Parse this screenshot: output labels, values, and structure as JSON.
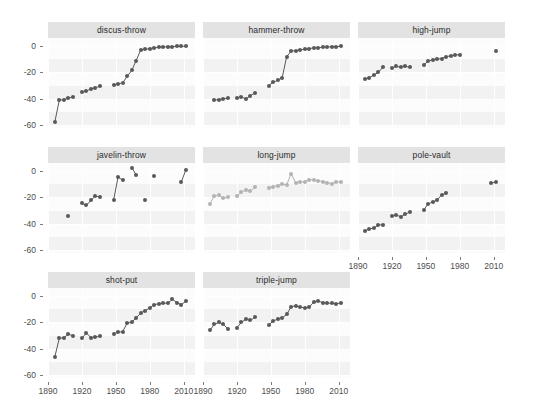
{
  "chart_data": {
    "type": "scatter",
    "title": "",
    "subtitle": "",
    "xlabel": "",
    "ylabel": "",
    "xlim": [
      1890,
      2020
    ],
    "ylim": [
      -62,
      6
    ],
    "xticks": [
      1890,
      1920,
      1950,
      1980,
      2010
    ],
    "yticks": [
      0,
      -20,
      -40,
      -60
    ],
    "xtick_labels": [
      "1890",
      "1920",
      "1950",
      "1980",
      "2010"
    ],
    "ytick_labels": [
      "0",
      "-20",
      "-40",
      "-60"
    ],
    "grid": true,
    "legend_position": "none",
    "facet_layout": {
      "rows": 3,
      "cols": 3,
      "free_axes": false
    },
    "colors": {
      "point_dark": "#595959",
      "point_light": "#b3b3b3",
      "strip_background": "#e3e3e3",
      "panel_background": "#fcfcfc",
      "panel_band": "#f2f2f2",
      "gridline": "#ffffff",
      "axis_text": "#4d4d4d",
      "strip_text": "#2b2b2b"
    },
    "panels": [
      {
        "name": "discus-throw",
        "row": 0,
        "col": 0,
        "color": "point_dark",
        "connect_lines": true,
        "x": [
          1896,
          1900,
          1904,
          1908,
          1912,
          1920,
          1924,
          1928,
          1932,
          1936,
          1948,
          1952,
          1956,
          1960,
          1964,
          1968,
          1972,
          1976,
          1980,
          1984,
          1988,
          1992,
          1996,
          2000,
          2004,
          2008,
          2012
        ],
        "y": [
          -57.5,
          -41.0,
          -40.5,
          -39.5,
          -38.5,
          -35.0,
          -34.0,
          -32.5,
          -31.5,
          -30.5,
          -29.5,
          -28.5,
          -28.0,
          -23.0,
          -18.5,
          -11.0,
          -3.0,
          -2.5,
          -2.0,
          -1.5,
          -1.0,
          -0.8,
          -0.6,
          -0.5,
          -0.4,
          -0.3,
          -0.2
        ]
      },
      {
        "name": "hammer-throw",
        "row": 0,
        "col": 1,
        "color": "point_dark",
        "connect_lines": true,
        "x": [
          1900,
          1904,
          1908,
          1912,
          1920,
          1924,
          1928,
          1932,
          1936,
          1948,
          1952,
          1956,
          1960,
          1964,
          1968,
          1972,
          1976,
          1980,
          1984,
          1988,
          1992,
          1996,
          2000,
          2004,
          2008,
          2012
        ],
        "y": [
          -41.0,
          -40.5,
          -40.0,
          -39.5,
          -39.0,
          -38.5,
          -40.0,
          -37.5,
          -35.5,
          -30.0,
          -27.5,
          -26.0,
          -24.0,
          -8.0,
          -4.0,
          -3.5,
          -3.0,
          -2.5,
          -2.0,
          -1.5,
          -1.2,
          -1.0,
          -0.8,
          -0.6,
          -0.5,
          -0.3
        ]
      },
      {
        "name": "high-jump",
        "row": 0,
        "col": 2,
        "color": "point_dark",
        "connect_lines": true,
        "x": [
          1896,
          1900,
          1904,
          1908,
          1912,
          1920,
          1924,
          1928,
          1932,
          1936,
          1948,
          1952,
          1956,
          1960,
          1964,
          1968,
          1972,
          1976,
          1980,
          2012
        ],
        "y": [
          -25.0,
          -24.0,
          -22.0,
          -20.0,
          -16.0,
          -16.5,
          -15.5,
          -16.0,
          -15.5,
          -16.0,
          -14.5,
          -11.5,
          -10.5,
          -10.0,
          -9.5,
          -8.0,
          -7.5,
          -7.0,
          -6.5,
          -4.0
        ]
      },
      {
        "name": "javelin-throw",
        "row": 1,
        "col": 0,
        "color": "point_dark",
        "connect_lines": true,
        "x": [
          1908,
          1920,
          1924,
          1928,
          1932,
          1936,
          1948,
          1952,
          1956,
          1964,
          1968,
          1976,
          1984,
          2008,
          2012
        ],
        "y": [
          -34.0,
          -24.5,
          -26.0,
          -22.0,
          -19.0,
          -19.5,
          -22.0,
          -4.5,
          -7.0,
          2.5,
          -3.0,
          -22.0,
          -3.5,
          -8.0,
          1.0
        ]
      },
      {
        "name": "long-jump",
        "row": 1,
        "col": 1,
        "color": "point_light",
        "connect_lines": true,
        "x": [
          1896,
          1900,
          1904,
          1908,
          1912,
          1920,
          1924,
          1928,
          1932,
          1936,
          1948,
          1952,
          1956,
          1960,
          1964,
          1968,
          1972,
          1976,
          1980,
          1984,
          1988,
          1992,
          1996,
          2000,
          2004,
          2008,
          2012
        ],
        "y": [
          -25.0,
          -19.0,
          -18.5,
          -20.5,
          -20.0,
          -19.0,
          -16.0,
          -14.5,
          -15.5,
          -12.0,
          -13.0,
          -12.0,
          -11.0,
          -10.0,
          -10.5,
          -2.0,
          -9.0,
          -8.5,
          -8.0,
          -6.5,
          -7.0,
          -7.5,
          -8.0,
          -9.0,
          -9.5,
          -8.5,
          -8.0
        ]
      },
      {
        "name": "pole-vault",
        "row": 1,
        "col": 2,
        "color": "point_dark",
        "connect_lines": true,
        "x": [
          1896,
          1900,
          1904,
          1908,
          1912,
          1920,
          1924,
          1928,
          1932,
          1936,
          1948,
          1952,
          1956,
          1960,
          1964,
          1968,
          2008,
          2012
        ],
        "y": [
          -45.0,
          -44.0,
          -43.0,
          -41.0,
          -40.5,
          -34.0,
          -33.5,
          -34.5,
          -32.5,
          -31.0,
          -29.5,
          -25.0,
          -23.5,
          -22.0,
          -18.0,
          -17.0,
          -9.0,
          -8.5
        ]
      },
      {
        "name": "shot-put",
        "row": 2,
        "col": 0,
        "color": "point_dark",
        "connect_lines": true,
        "x": [
          1896,
          1900,
          1904,
          1908,
          1912,
          1920,
          1924,
          1928,
          1932,
          1936,
          1948,
          1952,
          1956,
          1960,
          1964,
          1968,
          1972,
          1976,
          1980,
          1984,
          1988,
          1992,
          1996,
          2000,
          2004,
          2008,
          2012
        ],
        "y": [
          -46.0,
          -32.0,
          -31.5,
          -29.0,
          -30.0,
          -32.0,
          -28.0,
          -31.5,
          -31.0,
          -30.5,
          -28.5,
          -27.5,
          -27.0,
          -20.5,
          -20.0,
          -16.5,
          -13.0,
          -11.0,
          -9.0,
          -6.5,
          -6.0,
          -5.5,
          -5.5,
          -2.5,
          -5.0,
          -6.5,
          -4.0
        ]
      },
      {
        "name": "triple-jump",
        "row": 2,
        "col": 1,
        "color": "point_dark",
        "connect_lines": true,
        "x": [
          1896,
          1900,
          1904,
          1908,
          1912,
          1920,
          1924,
          1928,
          1932,
          1936,
          1948,
          1952,
          1956,
          1960,
          1964,
          1968,
          1972,
          1976,
          1980,
          1984,
          1988,
          1992,
          1996,
          2000,
          2004,
          2008,
          2012
        ],
        "y": [
          -26.0,
          -21.5,
          -20.0,
          -21.5,
          -25.0,
          -24.0,
          -20.0,
          -17.5,
          -18.5,
          -16.0,
          -22.0,
          -19.0,
          -17.5,
          -16.5,
          -14.0,
          -8.0,
          -7.5,
          -8.5,
          -9.0,
          -8.5,
          -4.5,
          -4.0,
          -5.0,
          -5.5,
          -5.5,
          -6.0,
          -5.0
        ]
      }
    ]
  }
}
